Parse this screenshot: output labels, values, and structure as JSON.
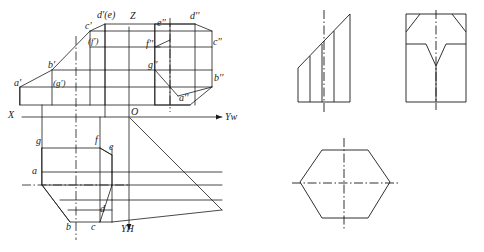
{
  "figure": {
    "axes": {
      "origin_label": "O",
      "x_label": "X",
      "z_label": "Z",
      "yw_label": "Yw",
      "yh_label": "YH"
    },
    "labels_main": [
      {
        "id": "a-prime",
        "text": "a'",
        "x": 14,
        "y": 84
      },
      {
        "id": "b-prime",
        "text": "b'",
        "x": 48,
        "y": 66
      },
      {
        "id": "g-prime",
        "text": "(g')",
        "x": 52,
        "y": 85
      },
      {
        "id": "c-prime",
        "text": "c'",
        "x": 87,
        "y": 27
      },
      {
        "id": "f-prime",
        "text": "(f')",
        "x": 88,
        "y": 43
      },
      {
        "id": "d-e-double-prime-top",
        "text": "d'(e)",
        "x": 99,
        "y": 16
      },
      {
        "id": "z-axis",
        "text": "Z",
        "x": 129,
        "y": 17
      },
      {
        "id": "e-double-prime",
        "text": "e''",
        "x": 158,
        "y": 24
      },
      {
        "id": "d-double-prime",
        "text": "d''",
        "x": 191,
        "y": 17
      },
      {
        "id": "f-double-prime",
        "text": "f''",
        "x": 146,
        "y": 45
      },
      {
        "id": "c-double-prime",
        "text": "c''",
        "x": 212,
        "y": 43
      },
      {
        "id": "g-double-prime",
        "text": "g''",
        "x": 148,
        "y": 66
      },
      {
        "id": "b-double-prime",
        "text": "b''",
        "x": 214,
        "y": 79
      },
      {
        "id": "a-double-prime",
        "text": "a''",
        "x": 180,
        "y": 99
      },
      {
        "id": "x-axis",
        "text": "X",
        "x": 10,
        "y": 116
      },
      {
        "id": "origin",
        "text": "O",
        "x": 131,
        "y": 115
      },
      {
        "id": "yw-axis",
        "text": "Yw",
        "x": 225,
        "y": 118
      },
      {
        "id": "g-plan",
        "text": "g",
        "x": 38,
        "y": 142
      },
      {
        "id": "f-plan",
        "text": "f",
        "x": 96,
        "y": 141
      },
      {
        "id": "e-plan",
        "text": "e",
        "x": 110,
        "y": 148
      },
      {
        "id": "a-plan",
        "text": "a",
        "x": 33,
        "y": 172
      },
      {
        "id": "d-plan",
        "text": "d",
        "x": 101,
        "y": 210
      },
      {
        "id": "b-plan",
        "text": "b",
        "x": 68,
        "y": 228
      },
      {
        "id": "c-plan",
        "text": "c",
        "x": 92,
        "y": 228
      },
      {
        "id": "yh-axis",
        "text": "YH",
        "x": 122,
        "y": 230
      }
    ]
  }
}
